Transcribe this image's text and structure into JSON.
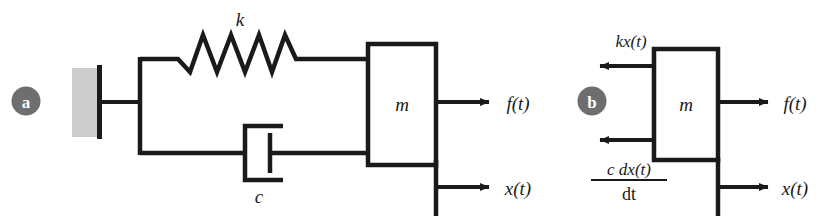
{
  "figure": {
    "background_color": "#ffffff",
    "line_color": "#1a1a1a",
    "wall_fill_color": "#cccccc",
    "badge_color": "#6e6e6e",
    "badge_text_color": "#ffffff"
  },
  "panel_a": {
    "badge_label": "a",
    "spring_label": "k",
    "damper_label": "c",
    "mass_label": "m",
    "force_label": "f(t)",
    "displacement_label": "x(t)"
  },
  "panel_b": {
    "badge_label": "b",
    "mass_label": "m",
    "spring_force_label": "kx(t)",
    "damper_force_numerator": "c dx(t)",
    "damper_force_denominator": "dt",
    "force_label": "f(t)",
    "displacement_label": "x(t)"
  }
}
